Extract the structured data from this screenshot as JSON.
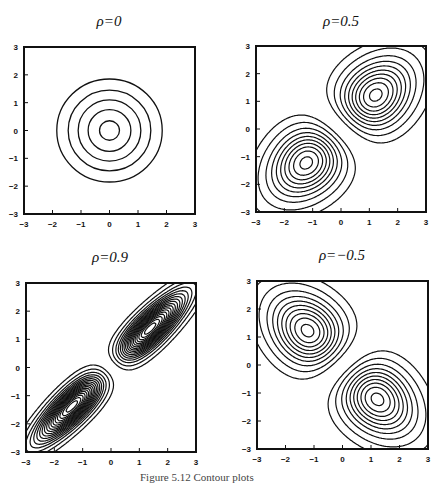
{
  "figure": {
    "caption": "Figure 5.12 Contour plots"
  },
  "chart_data": [
    {
      "type": "contour",
      "title": "ρ=0",
      "rho": 0,
      "xlim": [
        -3,
        3
      ],
      "ylim": [
        -3,
        3
      ],
      "xticks": [
        -3,
        -2,
        -1,
        0,
        1,
        2,
        3
      ],
      "yticks": [
        -3,
        -2,
        -1,
        0,
        1,
        2,
        3
      ],
      "shape": "circles",
      "contour_radii": [
        1.85,
        1.45,
        1.1,
        0.75,
        0.35
      ]
    },
    {
      "type": "contour",
      "title": "ρ=0.5",
      "rho": 0.5,
      "xlim": [
        -3,
        3
      ],
      "ylim": [
        -3,
        3
      ],
      "xticks": [
        -3,
        -2,
        -1,
        0,
        1,
        2,
        3
      ],
      "yticks": [
        -3,
        -2,
        -1,
        0,
        1,
        2,
        3
      ],
      "shape": "two-lobe",
      "lobe_peaks": [
        [
          0.35,
          0.35
        ],
        [
          -0.35,
          -0.35
        ]
      ],
      "levels": [
        0.02,
        0.05,
        0.09,
        0.13,
        0.17,
        0.21,
        0.25,
        0.29,
        0.33,
        0.37
      ]
    },
    {
      "type": "contour",
      "title": "ρ=0.9",
      "rho": 0.9,
      "xlim": [
        -3,
        3
      ],
      "ylim": [
        -3,
        3
      ],
      "xticks": [
        -3,
        -2,
        -1,
        0,
        1,
        2,
        3
      ],
      "yticks": [
        -3,
        -2,
        -1,
        0,
        1,
        2,
        3
      ],
      "shape": "two-lobe",
      "lobe_peaks": [
        [
          0.85,
          0.85
        ],
        [
          -0.85,
          -0.85
        ]
      ],
      "levels": [
        0.02,
        0.05,
        0.09,
        0.13,
        0.17,
        0.21,
        0.25,
        0.29,
        0.33,
        0.37,
        0.41,
        0.45,
        0.49,
        0.53,
        0.57,
        0.61,
        0.65,
        0.69
      ]
    },
    {
      "type": "contour",
      "title": "ρ=−0.5",
      "rho": -0.5,
      "xlim": [
        -3,
        3
      ],
      "ylim": [
        -3,
        3
      ],
      "xticks": [
        -3,
        -2,
        -1,
        0,
        1,
        2,
        3
      ],
      "yticks": [
        -3,
        -2,
        -1,
        0,
        1,
        2,
        3
      ],
      "shape": "two-lobe",
      "lobe_peaks": [
        [
          -0.35,
          0.35
        ],
        [
          0.35,
          -0.35
        ]
      ],
      "levels": [
        0.02,
        0.05,
        0.09,
        0.13,
        0.17,
        0.21,
        0.25,
        0.29,
        0.33,
        0.37
      ]
    }
  ]
}
